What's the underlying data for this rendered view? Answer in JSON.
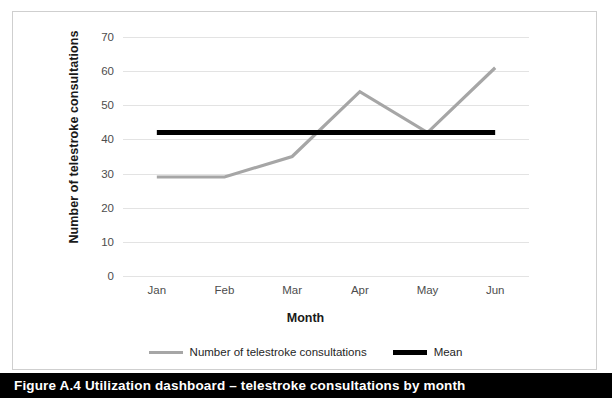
{
  "caption": {
    "text": "Figure A.4  Utilization dashboard – telestroke consultations by month",
    "background_color": "#000000",
    "text_color": "#ffffff"
  },
  "chart_data": {
    "type": "line",
    "title": "",
    "xlabel": "Month",
    "ylabel": "Number of telestroke consultations",
    "categories": [
      "Jan",
      "Feb",
      "Mar",
      "Apr",
      "May",
      "Jun"
    ],
    "series": [
      {
        "name": "Number of telestroke consultations",
        "color": "#a6a6a6",
        "values": [
          29,
          29,
          35,
          54,
          42,
          61
        ]
      },
      {
        "name": "Mean",
        "color": "#000000",
        "values": [
          42,
          42,
          42,
          42,
          42,
          42
        ]
      }
    ],
    "ylim": [
      0,
      70
    ],
    "yticks": [
      0,
      10,
      20,
      30,
      40,
      50,
      60,
      70
    ],
    "ytick_labels": [
      "0",
      "10",
      "20",
      "30",
      "40",
      "50",
      "60",
      "70"
    ],
    "grid": true,
    "grid_color": "#e3e3e3",
    "legend_position": "bottom",
    "legend": [
      {
        "label": "Number of telestroke consultations",
        "color": "#a6a6a6",
        "style": "thin"
      },
      {
        "label": "Mean",
        "color": "#000000",
        "style": "thick"
      }
    ],
    "plot_background": "#ffffff",
    "frame_color": "#cfcfcf"
  }
}
